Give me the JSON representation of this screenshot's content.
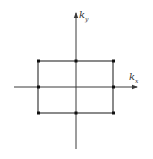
{
  "diagram": {
    "axes": {
      "x": {
        "label": "k",
        "subscript": "x"
      },
      "y": {
        "label": "k",
        "subscript": "y"
      }
    },
    "points": [
      {
        "name": "top-left",
        "kx": -1,
        "ky": 1
      },
      {
        "name": "top-mid",
        "kx": 0,
        "ky": 1
      },
      {
        "name": "top-right",
        "kx": 1,
        "ky": 1
      },
      {
        "name": "mid-left",
        "kx": -1,
        "ky": 0
      },
      {
        "name": "mid-right",
        "kx": 1,
        "ky": 0
      },
      {
        "name": "bottom-left",
        "kx": -1,
        "ky": -1
      },
      {
        "name": "bottom-mid",
        "kx": 0,
        "ky": -1
      },
      {
        "name": "bottom-right",
        "kx": 1,
        "ky": -1
      }
    ],
    "colors": {
      "line": "#2a2a2a",
      "point": "#111111",
      "background": "#ffffff"
    }
  }
}
